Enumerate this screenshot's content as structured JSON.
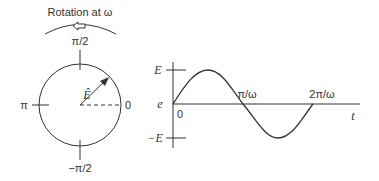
{
  "phasor": {
    "title": "Rotation at ω",
    "top_label": "π/2",
    "bottom_label": "−π/2",
    "left_label": "π",
    "right_label": "0",
    "vector_label": "Ê"
  },
  "waveform": {
    "y_max_label": "E",
    "y_origin_label": "e",
    "y_min_label": "−E",
    "x_origin_label": "0",
    "x_half_label": "π/ω",
    "x_full_label": "2π/ω",
    "x_axis_label": "t"
  },
  "colors": {
    "line": "#333333"
  }
}
